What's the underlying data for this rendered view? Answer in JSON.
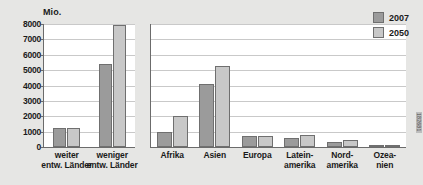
{
  "chart_data": [
    {
      "type": "bar",
      "title": "",
      "xlabel": "",
      "ylabel": "Mio.",
      "ylim": [
        0,
        8000
      ],
      "yticks": [
        0,
        1000,
        2000,
        3000,
        4000,
        5000,
        6000,
        7000,
        8000
      ],
      "ytick_labels": [
        "0",
        "1000",
        "2000",
        "3000",
        "4000",
        "5000",
        "6000",
        "7000",
        "8000"
      ],
      "grid": true,
      "legend": "none",
      "categories": [
        "weiter\nentw. Länder",
        "weniger\nentw. Länder"
      ],
      "category_labels": [
        {
          "line1": "weiter",
          "line2": "entw. Länder"
        },
        {
          "line1": "weniger",
          "line2": "entw. Länder"
        }
      ],
      "series": [
        {
          "name": "2007",
          "color": "#9b9b9b",
          "values": [
            1220,
            5400
          ]
        },
        {
          "name": "2050",
          "color": "#c8c8c8",
          "values": [
            1245,
            7950
          ]
        }
      ]
    },
    {
      "type": "bar",
      "title": "",
      "xlabel": "",
      "ylabel": "",
      "ylim": [
        0,
        8000
      ],
      "yticks": [
        0,
        1000,
        2000,
        3000,
        4000,
        5000,
        6000,
        7000,
        8000
      ],
      "grid": true,
      "legend": "top-right",
      "categories": [
        "Afrika",
        "Asien",
        "Europa",
        "Lateinamerika",
        "Nordamerika",
        "Ozeanien"
      ],
      "category_labels": [
        {
          "line1": "Afrika",
          "line2": ""
        },
        {
          "line1": "Asien",
          "line2": ""
        },
        {
          "line1": "Europa",
          "line2": ""
        },
        {
          "line1": "Latein-",
          "line2": "amerika"
        },
        {
          "line1": "Nord-",
          "line2": "amerika"
        },
        {
          "line1": "Ozea-",
          "line2": "nien"
        }
      ],
      "series": [
        {
          "name": "2007",
          "color": "#9b9b9b",
          "values": [
            960,
            4100,
            730,
            570,
            340,
            35
          ]
        },
        {
          "name": "2050",
          "color": "#c8c8c8",
          "values": [
            2000,
            5270,
            690,
            770,
            450,
            50
          ]
        }
      ]
    }
  ],
  "axis": {
    "unit_label": "Mio."
  },
  "legend": {
    "entries": [
      {
        "label": "2007",
        "color": "#9b9b9b"
      },
      {
        "label": "2050",
        "color": "#c8c8c8"
      }
    ]
  },
  "credit": {
    "text": "182681"
  },
  "colors": {
    "background": "#e6e6e4",
    "plot_background": "#ffffff",
    "axis": "#6b6b6b",
    "gridline": "#c9c9c9",
    "series_2007": "#9b9b9b",
    "series_2050": "#c8c8c8",
    "text": "#1a1a1a"
  }
}
